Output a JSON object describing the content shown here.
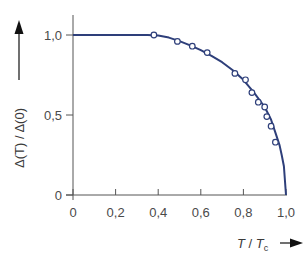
{
  "chart_data": {
    "type": "line",
    "title": "",
    "xlabel": "T / T_c",
    "ylabel": "Δ(T) / Δ(0)",
    "xlim": [
      0,
      1.0
    ],
    "ylim": [
      0,
      1.0
    ],
    "grid": false,
    "x_ticks": [
      "0",
      "0,2",
      "0,4",
      "0,6",
      "0,8",
      "1,0"
    ],
    "y_ticks": [
      "0",
      "0,5",
      "1,0"
    ],
    "series": [
      {
        "name": "BCS theory curve",
        "style": "line",
        "color": "#2e3f7a",
        "x": [
          0,
          0.1,
          0.2,
          0.3,
          0.35,
          0.4,
          0.45,
          0.5,
          0.55,
          0.6,
          0.65,
          0.7,
          0.75,
          0.8,
          0.85,
          0.9,
          0.93,
          0.95,
          0.97,
          0.98,
          0.99,
          1.0
        ],
        "y": [
          1.0,
          1.0,
          1.0,
          1.0,
          1.0,
          0.996,
          0.984,
          0.962,
          0.935,
          0.905,
          0.87,
          0.83,
          0.78,
          0.72,
          0.64,
          0.55,
          0.47,
          0.39,
          0.31,
          0.25,
          0.18,
          0.0
        ]
      },
      {
        "name": "Measured data",
        "style": "markers",
        "marker": "open-circle",
        "color": "#2e3f7a",
        "x": [
          0.38,
          0.49,
          0.56,
          0.63,
          0.76,
          0.81,
          0.84,
          0.87,
          0.9,
          0.91,
          0.93,
          0.95
        ],
        "y": [
          1.0,
          0.96,
          0.93,
          0.89,
          0.76,
          0.72,
          0.64,
          0.58,
          0.55,
          0.49,
          0.43,
          0.33
        ]
      }
    ]
  },
  "labels": {
    "x_axis_main": "T",
    "x_axis_sep": " / ",
    "x_axis_denom": "T",
    "x_axis_sub": "c",
    "y_axis": "Δ(T) / Δ(0)"
  }
}
